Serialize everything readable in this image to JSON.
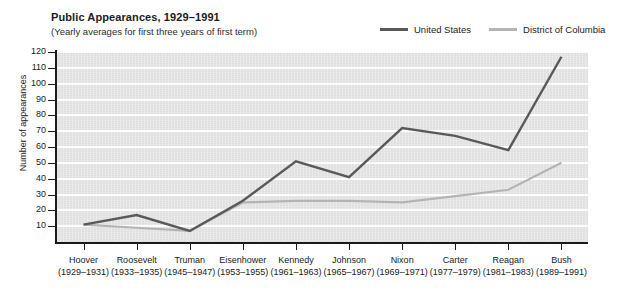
{
  "top_sliver_text": "",
  "header": {
    "title": "Public Appearances, 1929–1991",
    "subtitle": "(Yearly averages for first three years of first term)"
  },
  "legend": {
    "items": [
      {
        "label": "United States",
        "color": "#595959",
        "name": "legend-united-states"
      },
      {
        "label": "District of Columbia",
        "color": "#b4b4b4",
        "name": "legend-district-of-columbia"
      }
    ]
  },
  "axes": {
    "ylabel": "Number of appearances",
    "yticks": [
      "10",
      "20",
      "30",
      "40",
      "50",
      "60",
      "70",
      "80",
      "90",
      "100",
      "110",
      "120"
    ],
    "xticks": [
      {
        "name": "Hoover",
        "years": "(1929–1931)"
      },
      {
        "name": "Roosevelt",
        "years": "(1933–1935)"
      },
      {
        "name": "Truman",
        "years": "(1945–1947)"
      },
      {
        "name": "Eisenhower",
        "years": "(1953–1955)"
      },
      {
        "name": "Kennedy",
        "years": "(1961–1963)"
      },
      {
        "name": "Johnson",
        "years": "(1965–1967)"
      },
      {
        "name": "Nixon",
        "years": "(1969–1971)"
      },
      {
        "name": "Carter",
        "years": "(1977–1979)"
      },
      {
        "name": "Reagan",
        "years": "(1981–1983)"
      },
      {
        "name": "Bush",
        "years": "(1989–1991)"
      }
    ]
  },
  "chart_data": {
    "type": "line",
    "title": "Public Appearances, 1929–1991",
    "subtitle": "(Yearly averages for first three years of first term)",
    "xlabel": "",
    "ylabel": "Number of appearances",
    "ylim": [
      0,
      120
    ],
    "ytick_step": 10,
    "grid": true,
    "legend_position": "top-right",
    "categories": [
      "Hoover (1929–1931)",
      "Roosevelt (1933–1935)",
      "Truman (1945–1947)",
      "Eisenhower (1953–1955)",
      "Kennedy (1961–1963)",
      "Johnson (1965–1967)",
      "Nixon (1969–1971)",
      "Carter (1977–1979)",
      "Reagan (1981–1983)",
      "Bush (1989–1991)"
    ],
    "series": [
      {
        "name": "United States",
        "color": "#595959",
        "values": [
          11,
          17,
          7,
          26,
          51,
          41,
          72,
          67,
          58,
          117
        ]
      },
      {
        "name": "District of Columbia",
        "color": "#b4b4b4",
        "values": [
          11,
          9,
          7,
          25,
          26,
          26,
          25,
          29,
          33,
          50
        ]
      }
    ]
  }
}
